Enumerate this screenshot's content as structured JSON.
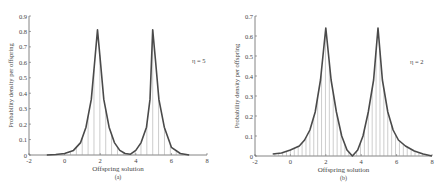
{
  "chart_data": [
    {
      "type": "line",
      "panel_label": "(a)",
      "title": "",
      "annotation": "η = 5",
      "xlabel": "Offspring solution",
      "ylabel": "Probability density per offspring",
      "xlim": [
        -2,
        8
      ],
      "ylim": [
        0,
        0.9
      ],
      "xticks": [
        -2,
        0,
        2,
        4,
        6,
        8
      ],
      "yticks": [
        0,
        0.1,
        0.2,
        0.3,
        0.4,
        0.5,
        0.6,
        0.7,
        0.8,
        0.9
      ],
      "grid": false,
      "legend": "none",
      "style": "line with vertical stems",
      "series": [
        {
          "name": "eta=5",
          "x": [
            -1.0,
            -0.5,
            0.0,
            0.5,
            0.9,
            1.2,
            1.5,
            1.7,
            1.85,
            2.0,
            2.2,
            2.5,
            2.8,
            3.1,
            3.4,
            3.7,
            4.0,
            4.3,
            4.6,
            4.8,
            4.95,
            5.1,
            5.3,
            5.6,
            6.0,
            6.5,
            7.0
          ],
          "y": [
            0.0,
            0.003,
            0.01,
            0.03,
            0.08,
            0.18,
            0.36,
            0.62,
            0.81,
            0.62,
            0.36,
            0.18,
            0.08,
            0.03,
            0.01,
            0.005,
            0.03,
            0.08,
            0.18,
            0.36,
            0.81,
            0.62,
            0.36,
            0.18,
            0.05,
            0.01,
            0.0
          ]
        }
      ]
    },
    {
      "type": "line",
      "panel_label": "(b)",
      "title": "",
      "annotation": "η = 2",
      "xlabel": "Offspring solution",
      "ylabel": "Probability density per offspring",
      "xlim": [
        -2,
        8
      ],
      "ylim": [
        0,
        0.7
      ],
      "xticks": [
        -2,
        0,
        2,
        4,
        6,
        8
      ],
      "yticks": [
        0,
        0.1,
        0.2,
        0.3,
        0.4,
        0.5,
        0.6,
        0.7
      ],
      "grid": false,
      "legend": "none",
      "style": "line with vertical stems",
      "series": [
        {
          "name": "eta=2",
          "x": [
            -1.0,
            -0.5,
            0.0,
            0.5,
            0.8,
            1.1,
            1.4,
            1.7,
            2.0,
            2.3,
            2.6,
            2.9,
            3.2,
            3.5,
            3.8,
            4.1,
            4.4,
            4.7,
            4.95,
            5.2,
            5.5,
            5.8,
            6.1,
            6.5,
            7.0,
            7.5,
            8.0
          ],
          "y": [
            0.01,
            0.015,
            0.03,
            0.05,
            0.08,
            0.13,
            0.22,
            0.38,
            0.64,
            0.38,
            0.22,
            0.1,
            0.03,
            0.0,
            0.03,
            0.1,
            0.22,
            0.38,
            0.64,
            0.38,
            0.22,
            0.13,
            0.08,
            0.05,
            0.025,
            0.01,
            0.0
          ]
        }
      ]
    }
  ]
}
